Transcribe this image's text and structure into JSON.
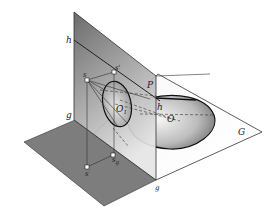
{
  "figure": {
    "colors": {
      "background": "#ffffff",
      "picture_plane_top": "#6e6e6e",
      "picture_plane_bottom": "#d8d8d8",
      "ground_plane_dark": "#7a7a7a",
      "ground_plane_light": "#f4f4f4",
      "outline": "#1a1a1a"
    },
    "labels": {
      "h_left": "h",
      "h_right": "h",
      "P": "P",
      "s": "s",
      "s_prime": "s'",
      "O1": "O",
      "O1_sub": "1",
      "O": "O",
      "G": "G",
      "g_left": "g",
      "g_bottom": "g",
      "s_ground": "s",
      "s_g": "s",
      "s_g_sub": "g"
    }
  }
}
